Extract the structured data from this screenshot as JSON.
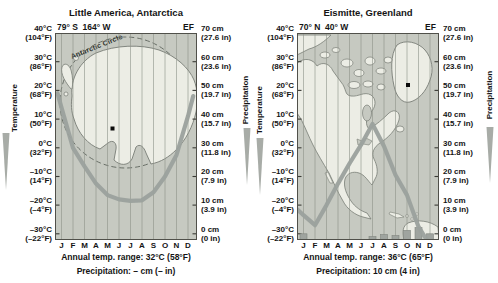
{
  "figure": {
    "axis_titles": {
      "temperature": "Temperature",
      "precipitation": "Precipitation"
    },
    "temp_axis_labels": [
      [
        "40°C",
        "(104°F)"
      ],
      [
        "30°C",
        "(86°F)"
      ],
      [
        "20°C",
        "(68°F)"
      ],
      [
        "10°C",
        "(50°F)"
      ],
      [
        "0°C",
        "(32°F)"
      ],
      [
        "–10°C",
        "(14°F)"
      ],
      [
        "–20°C",
        "(–4°F)"
      ],
      [
        "–30°C",
        "(–22°F)"
      ]
    ],
    "precip_axis_labels": [
      [
        "70 cm",
        "(27.6 in)"
      ],
      [
        "60 cm",
        "(23.6 in)"
      ],
      [
        "50 cm",
        "(19.7 in)"
      ],
      [
        "40 cm",
        "(15.7 in)"
      ],
      [
        "30 cm",
        "(11.8 in)"
      ],
      [
        "20 cm",
        "(7.9 in)"
      ],
      [
        "10 cm",
        "(3.9 in)"
      ],
      [
        "0 cm",
        "(0 in)"
      ]
    ],
    "months": [
      "J",
      "F",
      "M",
      "A",
      "M",
      "J",
      "J",
      "A",
      "S",
      "O",
      "N",
      "D"
    ]
  },
  "charts": [
    {
      "title": "Little America, Antarctica",
      "coordinates": "79° S  164° W",
      "climate_class": "EF",
      "map_label": "Antarctic Circle",
      "captions": {
        "range": "Annual temp. range: 32°C (58°F)",
        "precip": "Precipitation: – cm (– in)"
      }
    },
    {
      "title": "Eismitte, Greenland",
      "coordinates": "70° N  40° W",
      "climate_class": "EF",
      "captions": {
        "range": "Annual temp. range: 36°C (65°F)",
        "precip": "Precipitation: 10 cm (4 in)"
      }
    }
  ],
  "chart_data": [
    {
      "type": "line",
      "station": "Little America, Antarctica",
      "koppen": "EF",
      "categories": [
        "J",
        "F",
        "M",
        "A",
        "M",
        "J",
        "J",
        "A",
        "S",
        "O",
        "N",
        "D"
      ],
      "series": [
        {
          "name": "Mean monthly temperature (°C, as drawn)",
          "values": [
            14,
            0,
            -6.5,
            -12.5,
            -16.5,
            -18,
            -18.5,
            -18.3,
            -15.5,
            -10,
            -2.5,
            11
          ]
        }
      ],
      "curve_edge_points": {
        "pre": [
          -0.35,
          19
        ],
        "post": [
          11.45,
          18
        ]
      },
      "ylim_temp_c": [
        -30,
        40
      ],
      "ylim_precip_cm": [
        0,
        70
      ],
      "annual_range": "32°C (58°F)",
      "precipitation_total": "– cm (– in)",
      "grid": "vertical line per month",
      "legend": "none"
    },
    {
      "type": "line+bar",
      "station": "Eismitte, Greenland",
      "koppen": "EF",
      "categories": [
        "J",
        "F",
        "M",
        "A",
        "M",
        "J",
        "J",
        "A",
        "S",
        "O",
        "N",
        "D"
      ],
      "series": [
        {
          "name": "Mean monthly temperature (°C, as drawn)",
          "values": [
            -23.5,
            -27,
            -20,
            -12.5,
            -5.5,
            1,
            8.3,
            0.5,
            -9.5,
            -16.5,
            -27.5,
            -34
          ]
        }
      ],
      "precip_bars_cm": [
        2,
        0,
        0,
        0,
        0,
        0,
        1,
        1.7,
        1.4,
        3.2,
        4.2,
        2
      ],
      "curve_edge_points": {
        "pre": [
          -0.55,
          -21.5
        ]
      },
      "ylim_temp_c": [
        -30,
        40
      ],
      "ylim_precip_cm": [
        0,
        70
      ],
      "annual_range": "36°C (65°F)",
      "precipitation_total": "10 cm (4 in)",
      "grid": "vertical line per month",
      "legend": "none"
    }
  ]
}
